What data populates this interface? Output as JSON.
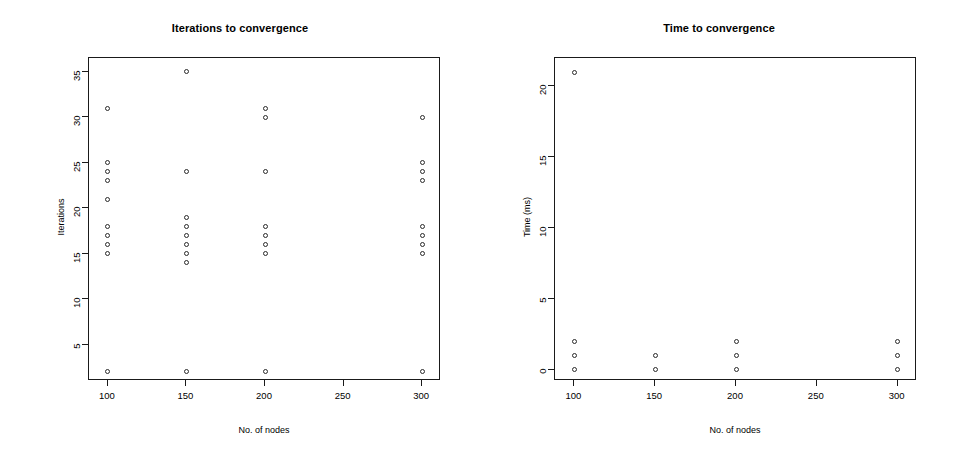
{
  "figure": {
    "background": "#ffffff",
    "marker_color": "#2a2a2a",
    "axis_color": "#1a1a1a"
  },
  "chart_data": [
    {
      "type": "scatter",
      "panel": "left",
      "title": "Iterations to convergence",
      "xlabel": "No. of nodes",
      "ylabel": "Iterations",
      "xlim": [
        88,
        312
      ],
      "ylim": [
        1,
        36.5
      ],
      "xticks": [
        100,
        150,
        200,
        250,
        300
      ],
      "yticks": [
        5,
        10,
        15,
        20,
        25,
        30,
        35
      ],
      "grid": false,
      "legend": null,
      "marker": "open-circle",
      "points": [
        {
          "x": 100,
          "y": 31
        },
        {
          "x": 100,
          "y": 25
        },
        {
          "x": 100,
          "y": 24
        },
        {
          "x": 100,
          "y": 23
        },
        {
          "x": 100,
          "y": 21
        },
        {
          "x": 100,
          "y": 18
        },
        {
          "x": 100,
          "y": 17
        },
        {
          "x": 100,
          "y": 16
        },
        {
          "x": 100,
          "y": 15
        },
        {
          "x": 100,
          "y": 2
        },
        {
          "x": 150,
          "y": 35
        },
        {
          "x": 150,
          "y": 24
        },
        {
          "x": 150,
          "y": 19
        },
        {
          "x": 150,
          "y": 18
        },
        {
          "x": 150,
          "y": 17
        },
        {
          "x": 150,
          "y": 16
        },
        {
          "x": 150,
          "y": 15
        },
        {
          "x": 150,
          "y": 14
        },
        {
          "x": 150,
          "y": 2
        },
        {
          "x": 200,
          "y": 31
        },
        {
          "x": 200,
          "y": 30
        },
        {
          "x": 200,
          "y": 24
        },
        {
          "x": 200,
          "y": 18
        },
        {
          "x": 200,
          "y": 17
        },
        {
          "x": 200,
          "y": 16
        },
        {
          "x": 200,
          "y": 15
        },
        {
          "x": 200,
          "y": 2
        },
        {
          "x": 300,
          "y": 30
        },
        {
          "x": 300,
          "y": 25
        },
        {
          "x": 300,
          "y": 24
        },
        {
          "x": 300,
          "y": 23
        },
        {
          "x": 300,
          "y": 18
        },
        {
          "x": 300,
          "y": 17
        },
        {
          "x": 300,
          "y": 16
        },
        {
          "x": 300,
          "y": 15
        },
        {
          "x": 300,
          "y": 2
        }
      ]
    },
    {
      "type": "scatter",
      "panel": "right",
      "title": "Time to convergence",
      "xlabel": "No. of nodes",
      "ylabel": "Time (ms)",
      "xlim": [
        88,
        312
      ],
      "ylim": [
        -0.8,
        22
      ],
      "xticks": [
        100,
        150,
        200,
        250,
        300
      ],
      "yticks": [
        0,
        5,
        10,
        15,
        20
      ],
      "grid": false,
      "legend": null,
      "marker": "open-circle",
      "points": [
        {
          "x": 100,
          "y": 21
        },
        {
          "x": 100,
          "y": 2
        },
        {
          "x": 100,
          "y": 1
        },
        {
          "x": 100,
          "y": 0
        },
        {
          "x": 150,
          "y": 1
        },
        {
          "x": 150,
          "y": 0
        },
        {
          "x": 200,
          "y": 2
        },
        {
          "x": 200,
          "y": 1
        },
        {
          "x": 200,
          "y": 0
        },
        {
          "x": 300,
          "y": 2
        },
        {
          "x": 300,
          "y": 1
        },
        {
          "x": 300,
          "y": 0
        }
      ]
    }
  ]
}
